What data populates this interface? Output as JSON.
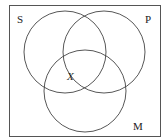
{
  "diagram": {
    "type": "venn",
    "frame": {
      "x": 9,
      "y": 5,
      "width": 152,
      "height": 132,
      "stroke": "#555555"
    },
    "sets": [
      {
        "label": "S",
        "cx": 65,
        "cy": 52,
        "r": 41,
        "label_x": 17,
        "label_y": 23
      },
      {
        "label": "P",
        "cx": 104,
        "cy": 52,
        "r": 41,
        "label_x": 145,
        "label_y": 23
      },
      {
        "label": "M",
        "cx": 85,
        "cy": 91,
        "r": 41,
        "label_x": 133,
        "label_y": 130
      }
    ],
    "marker": {
      "label": "X",
      "x": 67,
      "y": 80
    }
  }
}
